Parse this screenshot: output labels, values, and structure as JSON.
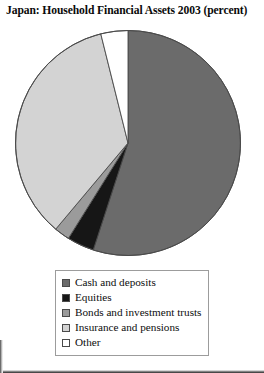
{
  "chart_data": {
    "type": "pie",
    "title": "Japan: Household Financial Assets 2003 (percent)",
    "xlabel": "",
    "ylabel": "",
    "legend_position": "bottom",
    "grid": false,
    "units": "percent",
    "start_angle_deg": 0,
    "direction": "clockwise",
    "categories": [
      "Cash and deposits",
      "Equities",
      "Bonds and investment trusts",
      "Insurance and pensions",
      "Other"
    ],
    "values": [
      55,
      4,
      2,
      35,
      4
    ],
    "colors": [
      "#6b6b6b",
      "#161616",
      "#9b9b9b",
      "#d3d3d3",
      "#ffffff"
    ],
    "slices": [
      {
        "label": "Cash and deposits",
        "value": 55,
        "color": "#6b6b6b",
        "start_deg": 0,
        "end_deg": 198
      },
      {
        "label": "Equities",
        "value": 4,
        "color": "#161616",
        "start_deg": 198,
        "end_deg": 212
      },
      {
        "label": "Bonds and investment trusts",
        "value": 2,
        "color": "#9b9b9b",
        "start_deg": 212,
        "end_deg": 220
      },
      {
        "label": "Insurance and pensions",
        "value": 35,
        "color": "#d3d3d3",
        "start_deg": 220,
        "end_deg": 346
      },
      {
        "label": "Other",
        "value": 4,
        "color": "#ffffff",
        "start_deg": 346,
        "end_deg": 360
      }
    ]
  },
  "legend": {
    "items": [
      {
        "label": "Cash and deposits",
        "color": "#6b6b6b"
      },
      {
        "label": "Equities",
        "color": "#161616"
      },
      {
        "label": "Bonds and investment trusts",
        "color": "#9b9b9b"
      },
      {
        "label": "Insurance and pensions",
        "color": "#d3d3d3"
      },
      {
        "label": "Other",
        "color": "#ffffff"
      }
    ]
  },
  "style": {
    "outline_color": "#4a4a4a",
    "legend_border_color": "#9c9c9c",
    "background": "#ffffff"
  }
}
